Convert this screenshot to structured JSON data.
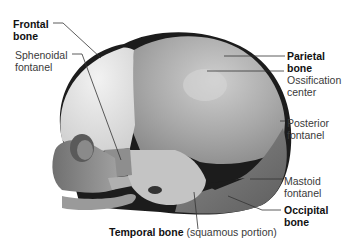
{
  "figure": {
    "labels": {
      "frontal_bone": [
        "Frontal",
        "bone"
      ],
      "sphenoidal_fontanel": [
        "Sphenoidal",
        "fontanel"
      ],
      "parietal_bone": [
        "Parietal",
        "bone"
      ],
      "ossification_center": [
        "Ossification",
        "center"
      ],
      "posterior_fontanel": [
        "Posterior",
        "fontanel"
      ],
      "mastoid_fontanel": [
        "Mastoid",
        "fontanel"
      ],
      "occipital_bone": [
        "Occipital",
        "bone"
      ],
      "temporal_bone": "Temporal bone",
      "temporal_bone_note": "(squamous portion)"
    },
    "colors": {
      "frontal": "#e6e6e6",
      "parietal": "#a9a9a9",
      "occipital": "#7a7a7a",
      "temporal": "#bdbdbd",
      "fontanel": "#1c1c1c",
      "leader_line": "#333333"
    }
  }
}
